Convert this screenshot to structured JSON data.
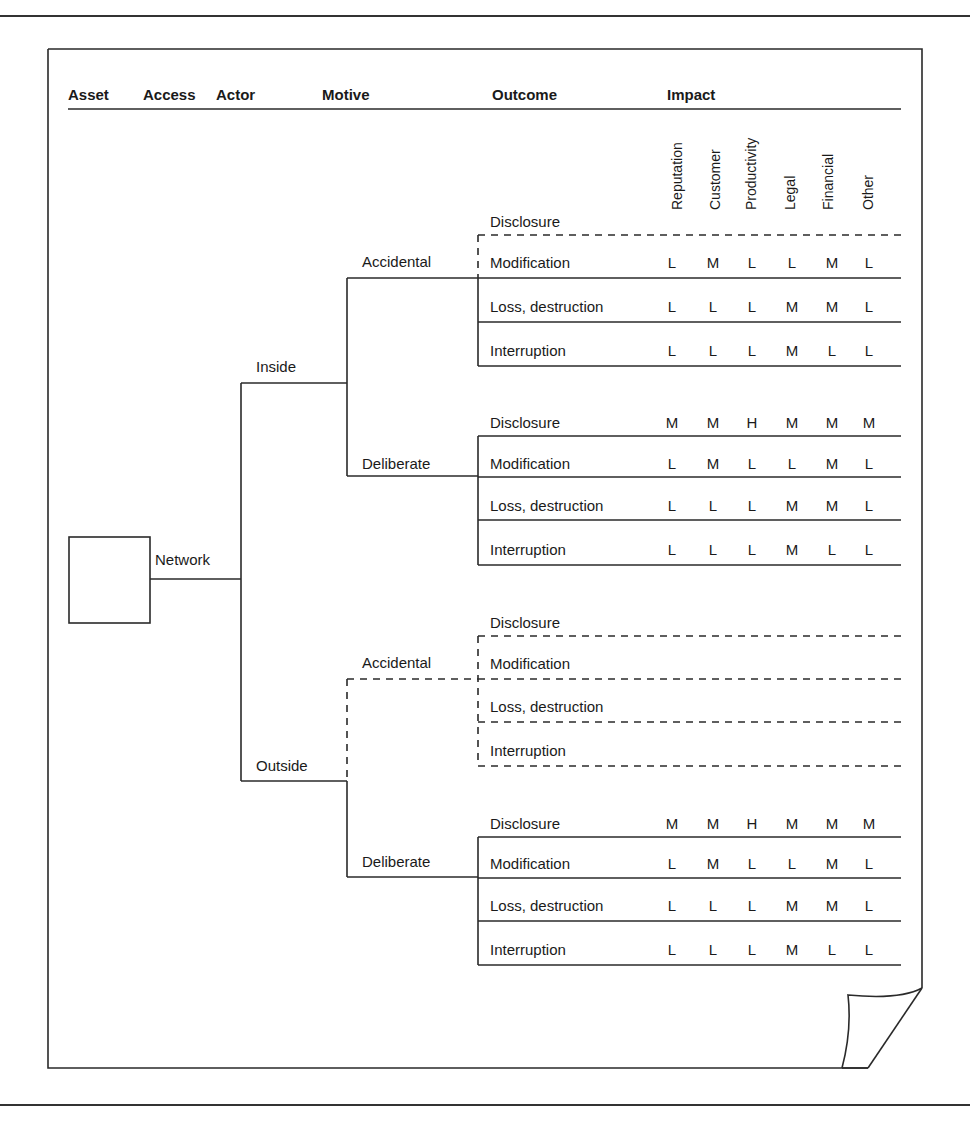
{
  "diagram": {
    "headers": {
      "asset": "Asset",
      "access": "Access",
      "actor": "Actor",
      "motive": "Motive",
      "outcome": "Outcome",
      "impact": "Impact"
    },
    "impact_columns": [
      "Reputation",
      "Customer",
      "Productivity",
      "Legal",
      "Financial",
      "Other"
    ],
    "access": {
      "label": "Network"
    },
    "actors": [
      {
        "label": "Inside",
        "motives": [
          {
            "label": "Accidental",
            "rows": [
              {
                "outcome": "Disclosure",
                "values": []
              },
              {
                "outcome": "Modification",
                "values": [
                  "L",
                  "M",
                  "L",
                  "L",
                  "M",
                  "L"
                ]
              },
              {
                "outcome": "Loss, destruction",
                "values": [
                  "L",
                  "L",
                  "L",
                  "M",
                  "M",
                  "L"
                ]
              },
              {
                "outcome": "Interruption",
                "values": [
                  "L",
                  "L",
                  "L",
                  "M",
                  "L",
                  "L"
                ]
              }
            ]
          },
          {
            "label": "Deliberate",
            "rows": [
              {
                "outcome": "Disclosure",
                "values": [
                  "M",
                  "M",
                  "H",
                  "M",
                  "M",
                  "M"
                ]
              },
              {
                "outcome": "Modification",
                "values": [
                  "L",
                  "M",
                  "L",
                  "L",
                  "M",
                  "L"
                ]
              },
              {
                "outcome": "Loss, destruction",
                "values": [
                  "L",
                  "L",
                  "L",
                  "M",
                  "M",
                  "L"
                ]
              },
              {
                "outcome": "Interruption",
                "values": [
                  "L",
                  "L",
                  "L",
                  "M",
                  "L",
                  "L"
                ]
              }
            ]
          }
        ]
      },
      {
        "label": "Outside",
        "motives": [
          {
            "label": "Accidental",
            "rows": [
              {
                "outcome": "Disclosure",
                "values": []
              },
              {
                "outcome": "Modification",
                "values": []
              },
              {
                "outcome": "Loss, destruction",
                "values": []
              },
              {
                "outcome": "Interruption",
                "values": []
              }
            ]
          },
          {
            "label": "Deliberate",
            "rows": [
              {
                "outcome": "Disclosure",
                "values": [
                  "M",
                  "M",
                  "H",
                  "M",
                  "M",
                  "M"
                ]
              },
              {
                "outcome": "Modification",
                "values": [
                  "L",
                  "M",
                  "L",
                  "L",
                  "M",
                  "L"
                ]
              },
              {
                "outcome": "Loss, destruction",
                "values": [
                  "L",
                  "L",
                  "L",
                  "M",
                  "M",
                  "L"
                ]
              },
              {
                "outcome": "Interruption",
                "values": [
                  "L",
                  "L",
                  "L",
                  "M",
                  "L",
                  "L"
                ]
              }
            ]
          }
        ]
      }
    ]
  },
  "caption": {
    "text": ""
  }
}
